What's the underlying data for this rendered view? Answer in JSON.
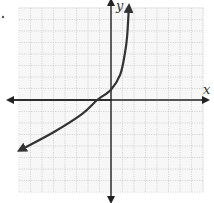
{
  "chart_data": {
    "type": "line",
    "title": "",
    "xlabel": "x",
    "ylabel": "y",
    "xlim": [
      -8,
      8
    ],
    "ylim": [
      -8,
      8
    ],
    "grid": true,
    "grid_style": "dotted",
    "tick_labels": false,
    "series": [
      {
        "name": "curve",
        "arrows": "both ends",
        "points": [
          {
            "x": -7.8,
            "y": -4.3
          },
          {
            "x": -5.0,
            "y": -2.8
          },
          {
            "x": -2.5,
            "y": -1.2
          },
          {
            "x": -1.2,
            "y": 0.0
          },
          {
            "x": 0.0,
            "y": 0.9
          },
          {
            "x": 0.8,
            "y": 2.2
          },
          {
            "x": 1.2,
            "y": 4.0
          },
          {
            "x": 1.4,
            "y": 5.5
          },
          {
            "x": 1.55,
            "y": 8.0
          }
        ]
      }
    ]
  },
  "labels": {
    "x_axis": "x",
    "y_axis": "y"
  },
  "colors": {
    "curve": "#333333",
    "axis": "#222222",
    "grid": "#bdbdbd"
  }
}
